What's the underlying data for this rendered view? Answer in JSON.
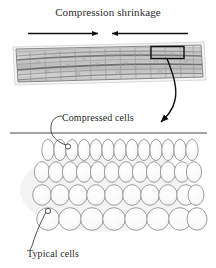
{
  "figure": {
    "title": "Compression shrinkage",
    "background_color": "#ffffff",
    "ink_color": "#262626"
  },
  "labels": {
    "compression_shrinkage": "Compression shrinkage",
    "compressed_cells": "Compressed cells",
    "typical_cells": "Typical cells"
  },
  "arrows": {
    "left_arrow_direction": "right",
    "right_arrow_direction": "left",
    "callout_arrow_direction": "down-left"
  },
  "timber_section": {
    "description": "timber board cross-section with curved annual growth rings",
    "fill_color": "#c9c9c9",
    "outline_color": "#8a8a8a",
    "detail_box_outline": "#111111"
  },
  "cell_diagram": {
    "divider_line_color": "#4a4a4a",
    "cell_outline_color": "#8d8d8d",
    "cell_fill_color": "#fbfbfb",
    "rows": [
      {
        "name": "compressed-row-1",
        "count": 13,
        "rx": 6.2,
        "ry": 10.5,
        "cy": 150,
        "roundness": "narrow-tall"
      },
      {
        "name": "compressed-row-2",
        "count": 12,
        "rx": 7.6,
        "ry": 10.2,
        "cy": 172,
        "roundness": "oval"
      },
      {
        "name": "transition-row-3",
        "count": 10,
        "rx": 9.2,
        "ry": 10.2,
        "cy": 195,
        "roundness": "wide-oval"
      },
      {
        "name": "typical-row-4",
        "count": 8,
        "rx": 11.2,
        "ry": 11.2,
        "cy": 219,
        "roundness": "circular"
      }
    ],
    "marker_compressed": {
      "cx": 68,
      "cy": 147,
      "r": 2.6
    },
    "marker_typical": {
      "cx": 48,
      "cy": 214,
      "r": 2.6
    }
  }
}
